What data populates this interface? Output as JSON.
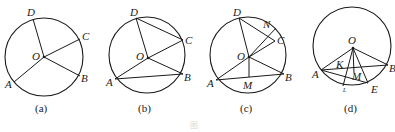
{
  "figures": [
    {
      "caption": "(a)",
      "points": {
        "D": "D",
        "C": "C",
        "O": "O",
        "A": "A",
        "B": "B"
      },
      "segments": [
        "OD",
        "OC",
        "OA",
        "OB"
      ]
    },
    {
      "caption": "(b)",
      "points": {
        "D": "D",
        "C": "C",
        "O": "O",
        "A": "A",
        "B": "B"
      },
      "segments": [
        "OD",
        "OC",
        "OA",
        "OB",
        "DC",
        "AB"
      ]
    },
    {
      "caption": "(c)",
      "points": {
        "D": "D",
        "N": "N",
        "C": "C",
        "O": "O",
        "A": "A",
        "M": "M",
        "B": "B"
      },
      "segments": [
        "OD",
        "OC",
        "OA",
        "OB",
        "DC",
        "AB",
        "ON",
        "OM"
      ]
    },
    {
      "caption": "(d)",
      "points": {
        "O": "O",
        "K": "K",
        "M": "M",
        "A": "A",
        "B": "B",
        "E": "E",
        "L": "L"
      },
      "segments": [
        "OA",
        "OB",
        "OE",
        "OL",
        "AB",
        "AE",
        "OM"
      ]
    }
  ],
  "figure_caption": "图"
}
